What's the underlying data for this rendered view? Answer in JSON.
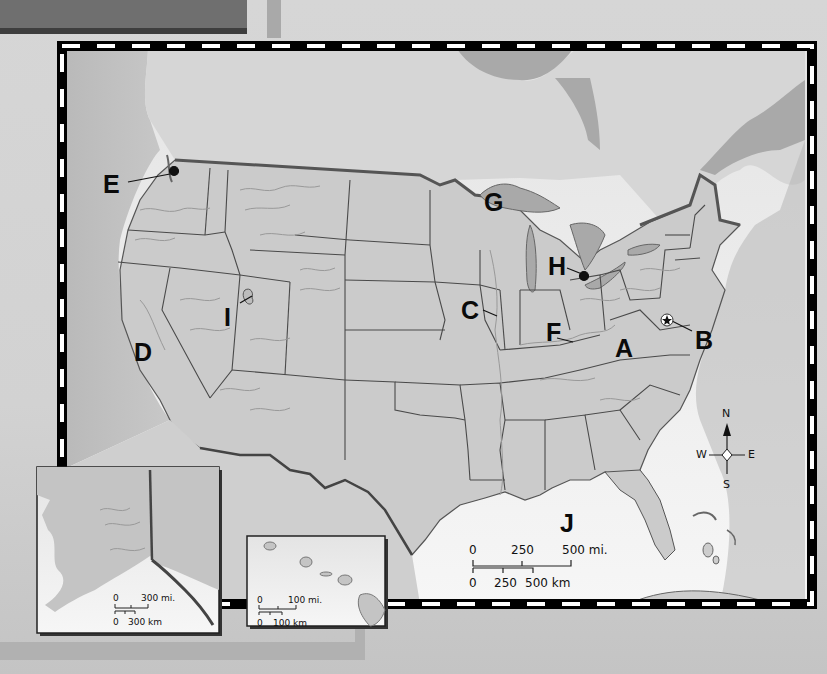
{
  "map": {
    "type": "outline map of the United States",
    "colors": {
      "land": "#c4c4c4",
      "us_land": "#cdcdcd",
      "water": "#e6e6e6",
      "border": "#000000",
      "dash": "#ffffff",
      "state_line": "#4a4a4a",
      "river": "#9a9a9a"
    },
    "labels": [
      {
        "id": "A",
        "text": "A",
        "description": "Appalachian region"
      },
      {
        "id": "B",
        "text": "B",
        "description": "Washington D.C. (star marker)"
      },
      {
        "id": "C",
        "text": "C",
        "description": "Mississippi River"
      },
      {
        "id": "D",
        "text": "D",
        "description": "California"
      },
      {
        "id": "E",
        "text": "E",
        "description": "Seattle area (dot marker)"
      },
      {
        "id": "F",
        "text": "F",
        "description": "Ohio River"
      },
      {
        "id": "G",
        "text": "G",
        "description": "Lake Superior"
      },
      {
        "id": "H",
        "text": "H",
        "description": "Detroit area (dot marker)"
      },
      {
        "id": "I",
        "text": "I",
        "description": "Great Salt Lake"
      },
      {
        "id": "J",
        "text": "J",
        "description": "Gulf of Mexico"
      }
    ],
    "compass": {
      "north": "N",
      "south": "S",
      "east": "E",
      "west": "W"
    },
    "main_scale": {
      "miles": [
        "0",
        "250",
        "500 mi."
      ],
      "km": [
        "0",
        "250",
        "500 km"
      ]
    },
    "alaska_inset": {
      "scale_miles": [
        "0",
        "300 mi."
      ],
      "scale_km": [
        "0",
        "300 km"
      ]
    },
    "hawaii_inset": {
      "scale_miles": [
        "0",
        "100 mi."
      ],
      "scale_km": [
        "0",
        "100 km"
      ]
    }
  }
}
